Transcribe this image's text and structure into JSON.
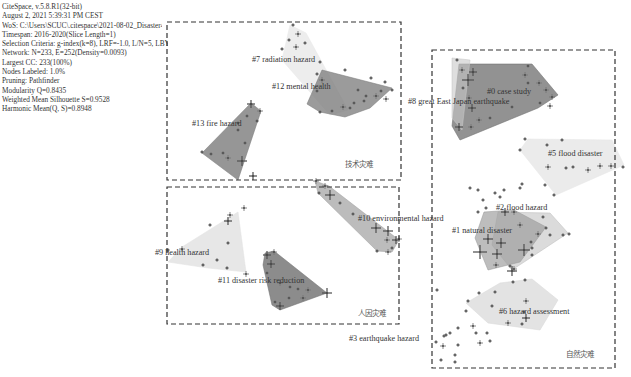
{
  "metadata": {
    "lines": [
      "CiteSpace, v.5.8.R1(32-bit)",
      "August 2, 2021 5:39:31 PM CEST",
      "WoS: C:\\Users\\SCUC\\.citespace\\2021-08-02_Disaster4\\Data",
      "Timespan: 2016-2020(Slice Length=1)",
      "Selection Criteria: g-index(k=8), LRF=-1.0, L/N=5, LBY=-1, e=2.0",
      "Network: N=233, E=252(Density=0.0093)",
      "Largest CC: 233(100%)",
      "Nodes Labeled: 1.0%",
      "Pruning: Pathfinder",
      "Modularity Q=0.8435",
      "Weighted Mean Silhouette S=0.9528",
      "Harmonic Mean(Q, S)=0.8948"
    ]
  },
  "groups": [
    {
      "id": "tech",
      "label": "技术灾难",
      "box": [
        167,
        22,
        234,
        158
      ]
    },
    {
      "id": "human",
      "label": "人因灾难",
      "box": [
        167,
        187,
        232,
        137
      ]
    },
    {
      "id": "natural",
      "label": "自然灾难",
      "box": [
        432,
        50,
        183,
        318
      ]
    }
  ],
  "clusters": [
    {
      "id": 0,
      "label": "#0 case study",
      "fill": "#6e6e6e",
      "opacity": 0.75,
      "polygon": "459,64 532,64 558,95 538,108 460,140 452,126",
      "label_xy": [
        487,
        94
      ]
    },
    {
      "id": 8,
      "label": "#8 great East Japan earthquake",
      "fill": "#c8c8c8",
      "opacity": 0.6,
      "polygon": "452,58 470,60 462,130 452,118",
      "label_xy": [
        408,
        104
      ]
    },
    {
      "id": 5,
      "label": "#5 flood disaster",
      "fill": "#e6e6e6",
      "opacity": 0.8,
      "polygon": "528,139 612,140 624,165 556,195 520,150",
      "label_xy": [
        548,
        156
      ]
    },
    {
      "id": 2,
      "label": "#2 flood hazard",
      "fill": "#bdbdbd",
      "opacity": 0.55,
      "polygon": "498,212 550,213 568,233 512,270 492,245",
      "label_xy": [
        496,
        210
      ]
    },
    {
      "id": 1,
      "label": "#1 natural disaster",
      "fill": "#9a9a9a",
      "opacity": 0.65,
      "polygon": "484,212 514,210 546,227 520,262 488,270 475,238",
      "label_xy": [
        452,
        233
      ]
    },
    {
      "id": 6,
      "label": "#6 hazard assessment",
      "fill": "#d9d9d9",
      "opacity": 0.75,
      "polygon": "500,283 532,279 558,300 540,330 488,323 466,303",
      "label_xy": [
        499,
        314
      ]
    },
    {
      "id": 7,
      "label": "#7 radiation hazard",
      "fill": "#e8e8e8",
      "opacity": 0.8,
      "polygon": "290,25 306,33 348,110 330,115 282,60",
      "label_xy": [
        252,
        62
      ]
    },
    {
      "id": 12,
      "label": "#12 mental health",
      "fill": "#7a7a7a",
      "opacity": 0.75,
      "polygon": "322,70 392,88 370,108 345,117 320,112 307,104",
      "label_xy": [
        272,
        89
      ]
    },
    {
      "id": 13,
      "label": "#13 fire hazard",
      "fill": "#7c7c7c",
      "opacity": 0.8,
      "polygon": "251,103 261,111 238,180 202,153",
      "label_xy": [
        192,
        126
      ]
    },
    {
      "id": 10,
      "label": "#10 environmental hazard",
      "fill": "#a0a0a0",
      "opacity": 0.7,
      "polygon": "315,181 329,186 399,240 392,252 377,251 318,193",
      "label_xy": [
        358,
        221
      ]
    },
    {
      "id": 9,
      "label": "#9 health hazard",
      "fill": "#e3e3e3",
      "opacity": 0.85,
      "polygon": "238,212 246,272 208,268 168,262 182,247",
      "label_xy": [
        155,
        255
      ]
    },
    {
      "id": 11,
      "label": "#11 disaster risk reduction",
      "fill": "#6f6f6f",
      "opacity": 0.8,
      "polygon": "265,253 274,251 327,293 280,310 272,305 263,265",
      "label_xy": [
        218,
        283
      ]
    },
    {
      "id": 3,
      "label": "#3 earthquake hazard",
      "fill": "none",
      "opacity": 0,
      "polygon": "",
      "label_xy": [
        349,
        341
      ]
    }
  ],
  "nodes": [
    [
      462,
      70,
      3
    ],
    [
      473,
      72,
      4
    ],
    [
      468,
      80,
      6
    ],
    [
      463,
      88,
      2
    ],
    [
      469,
      98,
      3
    ],
    [
      472,
      108,
      4
    ],
    [
      479,
      120,
      3
    ],
    [
      459,
      127,
      4
    ],
    [
      471,
      127,
      3
    ],
    [
      528,
      66,
      2
    ],
    [
      525,
      75,
      3
    ],
    [
      539,
      83,
      3
    ],
    [
      546,
      90,
      3
    ],
    [
      552,
      97,
      3
    ],
    [
      550,
      106,
      3
    ],
    [
      540,
      103,
      2
    ],
    [
      528,
      83,
      2
    ],
    [
      512,
      107,
      2
    ],
    [
      490,
      118,
      2
    ],
    [
      457,
      60,
      2
    ],
    [
      525,
      139,
      2
    ],
    [
      520,
      150,
      2
    ],
    [
      547,
      145,
      2
    ],
    [
      562,
      140,
      2
    ],
    [
      548,
      167,
      3
    ],
    [
      566,
      168,
      2
    ],
    [
      573,
      167,
      2
    ],
    [
      588,
      170,
      3
    ],
    [
      600,
      166,
      3
    ],
    [
      611,
      166,
      3
    ],
    [
      623,
      167,
      2
    ],
    [
      545,
      185,
      2
    ],
    [
      554,
      195,
      2
    ],
    [
      520,
      188,
      2
    ],
    [
      522,
      184,
      2
    ],
    [
      500,
      197,
      2
    ],
    [
      483,
      200,
      2
    ],
    [
      504,
      190,
      2
    ],
    [
      495,
      193,
      2
    ],
    [
      470,
      188,
      2
    ],
    [
      478,
      190,
      2
    ],
    [
      486,
      208,
      2
    ],
    [
      478,
      212,
      2
    ],
    [
      505,
      212,
      4
    ],
    [
      514,
      212,
      3
    ],
    [
      520,
      225,
      3
    ],
    [
      538,
      234,
      3
    ],
    [
      550,
      235,
      2
    ],
    [
      563,
      235,
      2
    ],
    [
      569,
      234,
      2
    ],
    [
      546,
      228,
      2
    ],
    [
      543,
      217,
      2
    ],
    [
      531,
      242,
      2
    ],
    [
      488,
      239,
      5
    ],
    [
      501,
      243,
      5
    ],
    [
      480,
      252,
      7
    ],
    [
      497,
      254,
      5
    ],
    [
      496,
      265,
      3
    ],
    [
      514,
      269,
      3
    ],
    [
      512,
      271,
      5
    ],
    [
      524,
      250,
      6
    ],
    [
      532,
      248,
      2
    ],
    [
      532,
      255,
      2
    ],
    [
      510,
      266,
      2
    ],
    [
      513,
      282,
      2
    ],
    [
      525,
      280,
      2
    ],
    [
      495,
      292,
      2
    ],
    [
      479,
      293,
      2
    ],
    [
      468,
      301,
      2
    ],
    [
      466,
      311,
      2
    ],
    [
      492,
      306,
      2
    ],
    [
      473,
      326,
      3
    ],
    [
      476,
      333,
      2
    ],
    [
      508,
      323,
      3
    ],
    [
      522,
      324,
      2
    ],
    [
      524,
      312,
      2
    ],
    [
      526,
      301,
      3
    ],
    [
      526,
      318,
      4
    ],
    [
      487,
      333,
      2
    ],
    [
      490,
      341,
      2
    ],
    [
      458,
      328,
      2
    ],
    [
      450,
      333,
      2
    ],
    [
      444,
      336,
      2
    ],
    [
      436,
      342,
      2
    ],
    [
      443,
      346,
      3
    ],
    [
      458,
      345,
      2
    ],
    [
      480,
      343,
      3
    ],
    [
      455,
      355,
      2
    ],
    [
      441,
      360,
      2
    ],
    [
      455,
      362,
      2
    ],
    [
      437,
      290,
      2
    ],
    [
      446,
      335,
      2
    ],
    [
      293,
      25,
      2
    ],
    [
      298,
      34,
      3
    ],
    [
      289,
      40,
      2
    ],
    [
      305,
      43,
      2
    ],
    [
      296,
      47,
      3
    ],
    [
      282,
      49,
      2
    ],
    [
      320,
      62,
      2
    ],
    [
      317,
      74,
      2
    ],
    [
      322,
      80,
      3
    ],
    [
      317,
      91,
      2
    ],
    [
      345,
      70,
      2
    ],
    [
      371,
      78,
      2
    ],
    [
      385,
      82,
      2
    ],
    [
      381,
      91,
      2
    ],
    [
      392,
      90,
      2
    ],
    [
      376,
      96,
      3
    ],
    [
      366,
      96,
      2
    ],
    [
      358,
      90,
      2
    ],
    [
      364,
      101,
      2
    ],
    [
      386,
      99,
      3
    ],
    [
      343,
      107,
      3
    ],
    [
      332,
      111,
      2
    ],
    [
      320,
      112,
      2
    ],
    [
      354,
      103,
      2
    ],
    [
      350,
      108,
      2
    ],
    [
      251,
      104,
      4
    ],
    [
      260,
      111,
      3
    ],
    [
      257,
      121,
      2
    ],
    [
      247,
      116,
      2
    ],
    [
      238,
      123,
      2
    ],
    [
      238,
      130,
      2
    ],
    [
      245,
      143,
      2
    ],
    [
      211,
      154,
      2
    ],
    [
      228,
      158,
      3
    ],
    [
      242,
      161,
      5
    ],
    [
      253,
      176,
      4
    ],
    [
      223,
      153,
      2
    ],
    [
      202,
      152,
      2
    ],
    [
      316,
      181,
      3
    ],
    [
      325,
      186,
      3
    ],
    [
      330,
      195,
      5
    ],
    [
      340,
      203,
      2
    ],
    [
      353,
      214,
      2
    ],
    [
      376,
      228,
      5
    ],
    [
      388,
      231,
      5
    ],
    [
      387,
      240,
      3
    ],
    [
      396,
      240,
      4
    ],
    [
      388,
      252,
      3
    ],
    [
      399,
      239,
      3
    ],
    [
      392,
      248,
      2
    ],
    [
      377,
      251,
      2
    ],
    [
      319,
      193,
      2
    ],
    [
      244,
      208,
      3
    ],
    [
      230,
      215,
      3
    ],
    [
      228,
      221,
      4
    ],
    [
      210,
      225,
      2
    ],
    [
      228,
      243,
      2
    ],
    [
      182,
      249,
      3
    ],
    [
      168,
      250,
      2
    ],
    [
      217,
      260,
      2
    ],
    [
      227,
      268,
      2
    ],
    [
      246,
      274,
      3
    ],
    [
      203,
      265,
      2
    ],
    [
      267,
      255,
      4
    ],
    [
      274,
      252,
      3
    ],
    [
      271,
      264,
      4
    ],
    [
      267,
      273,
      2
    ],
    [
      280,
      283,
      3
    ],
    [
      289,
      298,
      2
    ],
    [
      280,
      306,
      4
    ],
    [
      275,
      302,
      2
    ],
    [
      298,
      289,
      2
    ],
    [
      308,
      290,
      3
    ],
    [
      303,
      298,
      3
    ],
    [
      327,
      293,
      5
    ],
    [
      290,
      287,
      2
    ]
  ]
}
